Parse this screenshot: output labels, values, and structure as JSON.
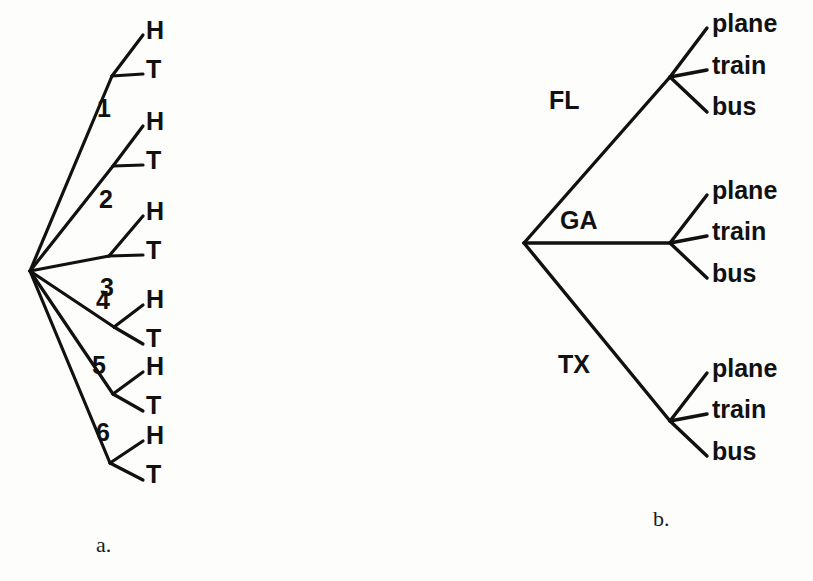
{
  "figure": {
    "background_color": "#fdfdfc",
    "ink_color": "#111111",
    "width": 813,
    "height": 581
  },
  "panel_a": {
    "caption": "a.",
    "caption_x": 96,
    "caption_y": 534,
    "description": "Tree diagram for rolling a die then tossing a coin",
    "root": {
      "x": 30,
      "y": 271
    },
    "stage1_label": "die roll",
    "stage2_label": "coin toss",
    "branches": [
      {
        "label": "1",
        "label_x": 97,
        "label_y": 96,
        "node": {
          "x": 112,
          "y": 76
        },
        "outcomes": [
          {
            "text": "H",
            "x": 146,
            "y": 18,
            "tip_x": 143,
            "tip_y": 35
          },
          {
            "text": "T",
            "x": 146,
            "y": 57,
            "tip_x": 143,
            "tip_y": 74
          }
        ]
      },
      {
        "label": "2",
        "label_x": 99,
        "label_y": 187,
        "node": {
          "x": 113,
          "y": 166
        },
        "outcomes": [
          {
            "text": "H",
            "x": 146,
            "y": 109,
            "tip_x": 143,
            "tip_y": 126
          },
          {
            "text": "T",
            "x": 146,
            "y": 148,
            "tip_x": 143,
            "tip_y": 165
          }
        ]
      },
      {
        "label": "3",
        "label_x": 100,
        "label_y": 275,
        "node": {
          "x": 109,
          "y": 256
        },
        "outcomes": [
          {
            "text": "H",
            "x": 146,
            "y": 199,
            "tip_x": 143,
            "tip_y": 216
          },
          {
            "text": "T",
            "x": 146,
            "y": 238,
            "tip_x": 143,
            "tip_y": 255
          }
        ]
      },
      {
        "label": "4",
        "label_x": 96,
        "label_y": 288,
        "node": {
          "x": 114,
          "y": 327
        },
        "outcomes": [
          {
            "text": "H",
            "x": 146,
            "y": 287,
            "tip_x": 143,
            "tip_y": 305
          },
          {
            "text": "T",
            "x": 146,
            "y": 326,
            "tip_x": 143,
            "tip_y": 344
          }
        ]
      },
      {
        "label": "5",
        "label_x": 92,
        "label_y": 353,
        "node": {
          "x": 113,
          "y": 394
        },
        "outcomes": [
          {
            "text": "H",
            "x": 146,
            "y": 354,
            "tip_x": 143,
            "tip_y": 372
          },
          {
            "text": "T",
            "x": 146,
            "y": 393,
            "tip_x": 143,
            "tip_y": 411
          }
        ]
      },
      {
        "label": "6",
        "label_x": 96,
        "label_y": 420,
        "node": {
          "x": 110,
          "y": 463
        },
        "outcomes": [
          {
            "text": "H",
            "x": 146,
            "y": 423,
            "tip_x": 143,
            "tip_y": 441
          },
          {
            "text": "T",
            "x": 146,
            "y": 462,
            "tip_x": 143,
            "tip_y": 480
          }
        ]
      }
    ]
  },
  "panel_b": {
    "caption": "b.",
    "caption_x": 653,
    "caption_y": 508,
    "description": "Tree diagram for choosing a destination state then a mode of travel",
    "root": {
      "x": 524,
      "y": 243
    },
    "stage1_label": "destination",
    "stage2_label": "mode of travel",
    "branches": [
      {
        "label": "FL",
        "label_x": 549,
        "label_y": 88,
        "node": {
          "x": 670,
          "y": 77
        },
        "outcomes": [
          {
            "text": "plane",
            "x": 712,
            "y": 11,
            "tip_x": 707,
            "tip_y": 28
          },
          {
            "text": "train",
            "x": 712,
            "y": 53,
            "tip_x": 707,
            "tip_y": 70
          },
          {
            "text": "bus",
            "x": 712,
            "y": 94,
            "tip_x": 707,
            "tip_y": 112
          }
        ]
      },
      {
        "label": "GA",
        "label_x": 560,
        "label_y": 208,
        "node": {
          "x": 670,
          "y": 243
        },
        "outcomes": [
          {
            "text": "plane",
            "x": 712,
            "y": 178,
            "tip_x": 707,
            "tip_y": 195
          },
          {
            "text": "train",
            "x": 712,
            "y": 219,
            "tip_x": 707,
            "tip_y": 236
          },
          {
            "text": "bus",
            "x": 712,
            "y": 261,
            "tip_x": 707,
            "tip_y": 278
          }
        ]
      },
      {
        "label": "TX",
        "label_x": 558,
        "label_y": 352,
        "node": {
          "x": 670,
          "y": 421
        },
        "outcomes": [
          {
            "text": "plane",
            "x": 712,
            "y": 356,
            "tip_x": 707,
            "tip_y": 373
          },
          {
            "text": "train",
            "x": 712,
            "y": 397,
            "tip_x": 707,
            "tip_y": 414
          },
          {
            "text": "bus",
            "x": 712,
            "y": 439,
            "tip_x": 707,
            "tip_y": 456
          }
        ]
      }
    ]
  }
}
